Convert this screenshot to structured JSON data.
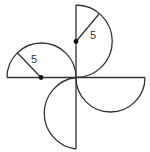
{
  "figure": {
    "semicircle_count": 4,
    "labels": {
      "top_radius": "5",
      "left_radius": "5"
    },
    "colors": {
      "line": "#333333",
      "background": "#ffffff"
    }
  }
}
